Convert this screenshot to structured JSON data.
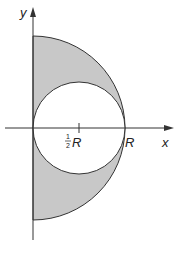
{
  "diagram": {
    "axes": {
      "x_label": "x",
      "y_label": "y"
    },
    "ticks": [
      {
        "label_num": "1",
        "label_den": "2",
        "label_var": "R",
        "position": 0.5
      },
      {
        "label": "R",
        "position": 1.0
      }
    ],
    "shapes": [
      {
        "type": "semicircle",
        "center": [
          0,
          0
        ],
        "radius": "R",
        "side": "right",
        "fill": "#c8c8c8"
      },
      {
        "type": "circle",
        "center": [
          "1/2 R",
          0
        ],
        "radius": "1/2 R",
        "fill": "#ffffff"
      }
    ],
    "colors": {
      "shade": "#c8c8c8",
      "stroke": "#333333"
    }
  }
}
